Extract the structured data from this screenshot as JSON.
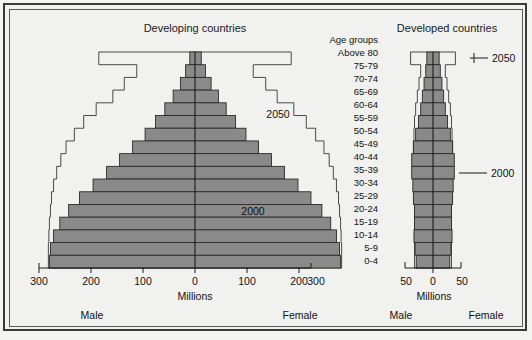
{
  "chart_data": {
    "type": "bar",
    "subtitle": "",
    "orientation": "horizontal-bidirectional",
    "age_group_header": "Age groups",
    "categories": [
      "Above 80",
      "75-79",
      "70-74",
      "65-69",
      "60-64",
      "55-59",
      "50-54",
      "45-49",
      "40-44",
      "35-39",
      "30-34",
      "25-29",
      "20-24",
      "15-19",
      "10-14",
      "5-9",
      "0-4"
    ],
    "panels": [
      {
        "name": "developing",
        "title": "Developing countries",
        "xlabel": "Millions",
        "xlim": [
          -300,
          300
        ],
        "xticks": [
          300,
          200,
          100,
          0,
          100,
          200,
          300
        ],
        "xtick_values": [
          -300,
          -200,
          -100,
          0,
          100,
          200,
          300
        ],
        "left_label": "Male",
        "right_label": "Female",
        "grid": false,
        "series": [
          {
            "name": "2000",
            "style": "filled-bars",
            "male": [
              10,
              18,
              28,
              42,
              58,
              76,
              96,
              120,
              145,
              170,
              196,
              222,
              243,
              260,
              272,
              278,
              280
            ],
            "female": [
              12,
              20,
              31,
              45,
              60,
              78,
              98,
              122,
              147,
              172,
              198,
              223,
              244,
              261,
              272,
              278,
              280
            ]
          },
          {
            "name": "2050",
            "style": "outline-step",
            "male": [
              185,
              112,
              136,
              158,
              190,
              214,
              232,
              248,
              258,
              266,
              272,
              276,
              278,
              280,
              281,
              282,
              282
            ],
            "female": [
              185,
              112,
              136,
              158,
              190,
              214,
              232,
              248,
              258,
              266,
              272,
              276,
              278,
              280,
              281,
              282,
              282
            ]
          }
        ]
      },
      {
        "name": "developed",
        "title": "Developed countries",
        "xlabel": "Millions",
        "xlim": [
          -50,
          50
        ],
        "xticks": [
          50,
          0,
          50
        ],
        "xtick_values": [
          -50,
          0,
          50
        ],
        "left_label": "Male",
        "right_label": "Female",
        "grid": false,
        "series": [
          {
            "name": "2000",
            "style": "filled-bars",
            "male": [
              11,
              13,
              16,
              19,
              22,
              26,
              31,
              35,
              38,
              38,
              36,
              35,
              33,
              33,
              34,
              32,
              30
            ],
            "female": [
              11,
              13,
              16,
              19,
              22,
              26,
              31,
              35,
              38,
              38,
              36,
              35,
              33,
              33,
              34,
              32,
              30
            ]
          },
          {
            "name": "2050",
            "style": "outline-step",
            "male": [
              40,
              22,
              25,
              28,
              31,
              33,
              34,
              35,
              35,
              35,
              34,
              34,
              33,
              33,
              33,
              33,
              33
            ],
            "female": [
              40,
              22,
              25,
              28,
              31,
              33,
              34,
              35,
              35,
              35,
              34,
              34,
              33,
              33,
              33,
              33,
              33
            ]
          }
        ],
        "annotations": [
          {
            "label": "2050",
            "target_category": "Above 80"
          },
          {
            "label": "2000",
            "target_category": "35-39"
          }
        ]
      }
    ],
    "legend": {
      "position": "inline-annotations",
      "entries": [
        {
          "label": "2000",
          "style": "filled-bars",
          "color": "#8a8a8a"
        },
        {
          "label": "2050",
          "style": "outline-step",
          "color": "#4a4a4a"
        }
      ]
    },
    "colors": {
      "bar_fill": "#8a8a8a",
      "bar_stroke": "#2a2a2a",
      "outline_stroke": "#4a4a4a",
      "axis": "#1a1a1a",
      "background": "#f1f1ef",
      "frame": "#3a3a3a"
    }
  },
  "labels": {
    "developing_title": "Developing countries",
    "developed_title": "Developed countries",
    "age_groups": "Age groups",
    "millions_left": "Millions",
    "millions_right": "Millions",
    "male_left": "Male",
    "female_left": "Female",
    "male_right": "Male",
    "female_right": "Female",
    "annot_2050_left": "2050",
    "annot_2000_left": "2000",
    "annot_2050_right": "2050",
    "annot_2000_right": "2000"
  },
  "age_labels": {
    "a0": "Above 80",
    "a1": "75-79",
    "a2": "70-74",
    "a3": "65-69",
    "a4": "60-64",
    "a5": "55-59",
    "a6": "50-54",
    "a7": "45-49",
    "a8": "40-44",
    "a9": "35-39",
    "a10": "30-34",
    "a11": "25-29",
    "a12": "20-24",
    "a13": "15-19",
    "a14": "10-14",
    "a15": "5-9",
    "a16": "0-4"
  },
  "ticks_left": {
    "t0": "300",
    "t1": "200",
    "t2": "100",
    "t3": "0",
    "t4": "100",
    "t5": "200",
    "t6": "300"
  },
  "ticks_right": {
    "t0": "50",
    "t1": "0",
    "t2": "50"
  }
}
